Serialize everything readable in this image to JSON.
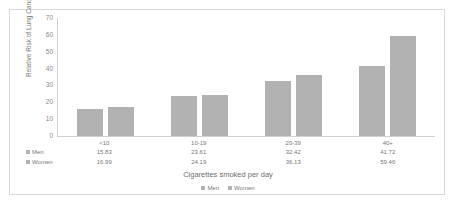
{
  "chart_data": {
    "type": "bar",
    "title": "",
    "subtitle": "",
    "xlabel": "Cigarettes smoked per day",
    "ylabel": "Relative Risk of Lung Cancer",
    "categories": [
      "<10",
      "10-19",
      "20-39",
      "40+"
    ],
    "series": [
      {
        "name": "Men",
        "values": [
          15.83,
          23.61,
          32.42,
          41.72
        ]
      },
      {
        "name": "Women",
        "values": [
          16.99,
          24.19,
          36.13,
          59.46
        ]
      }
    ],
    "yticks": [
      70,
      60,
      50,
      40,
      30,
      20,
      10,
      0
    ],
    "ylim": [
      0,
      70
    ],
    "grid": false,
    "legend_position": "bottom",
    "bar_color": "#b2b2b2",
    "axis_color": "#d0d0d0",
    "text_color": "#777777",
    "frame_color": "#d9d9d9",
    "background": "#ffffff"
  },
  "table": {
    "row_labels": [
      "Men",
      "Women"
    ]
  }
}
